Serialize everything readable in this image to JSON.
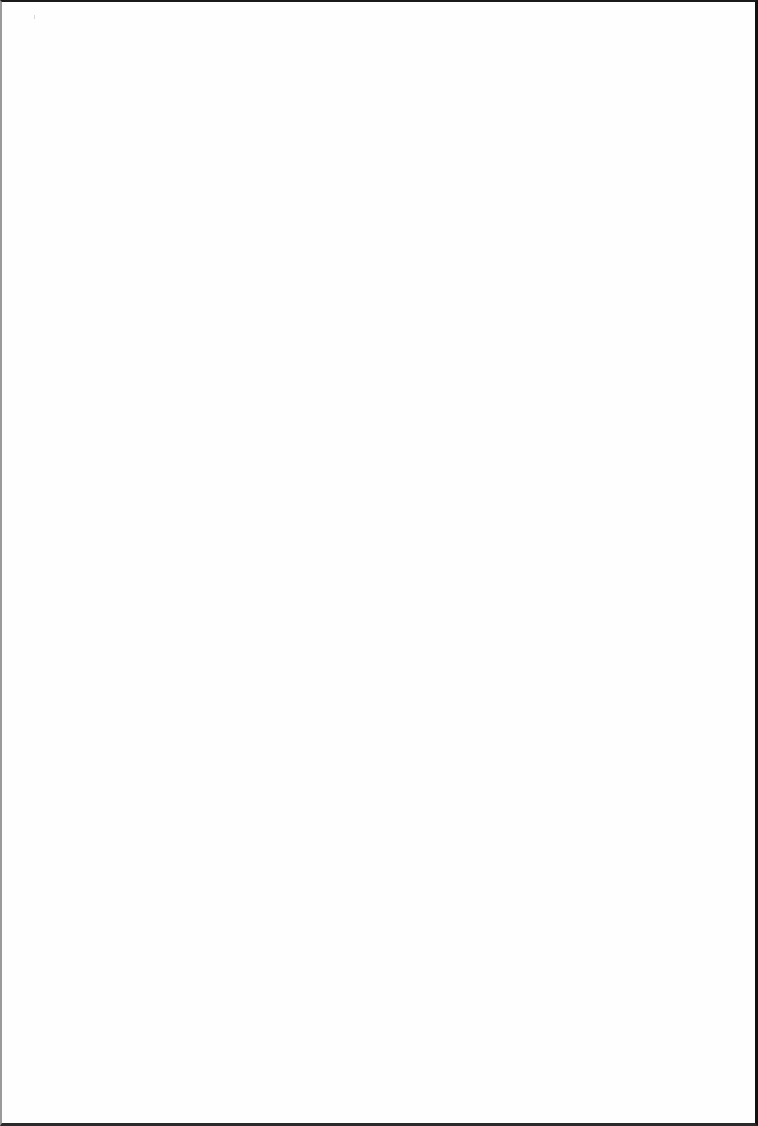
{
  "page": {
    "type": "blank-scanned-page",
    "background": "#ffffff",
    "border_color": "#111111",
    "faint_marks": [
      {
        "id": "right-edge-upper",
        "text": ""
      },
      {
        "id": "right-edge-lower",
        "text": ""
      },
      {
        "id": "center-right-block",
        "text": ""
      },
      {
        "id": "center-small",
        "text": ""
      }
    ]
  }
}
